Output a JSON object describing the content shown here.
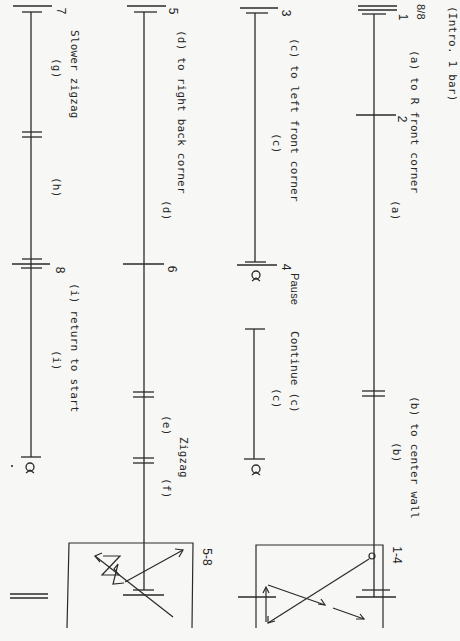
{
  "document": {
    "orientation": "rotated 90 degrees clockwise",
    "intro": "(Intro. 1 bar)",
    "staves": [
      {
        "id": "staff-1",
        "bars": [
          "1",
          "2"
        ],
        "meter": "8/8",
        "annotations": {
          "a_main": "(a) to R front corner",
          "a_label": "(a)",
          "b_main": "(b) to center wall",
          "b_label": "(b)"
        }
      },
      {
        "id": "staff-2",
        "bars": [
          "3",
          "4"
        ],
        "annotations": {
          "c_main": "(c) to left front corner",
          "c_label": "(c)",
          "pause": "Pause",
          "continue": "Continue (c)",
          "c_label2": "(c)"
        }
      },
      {
        "id": "staff-3",
        "bars": [
          "5",
          "6"
        ],
        "annotations": {
          "d_main": "(d) to right back corner",
          "d_label": "(d)",
          "e_label": "(e)",
          "zigzag": "Zigzag",
          "f_label": "(f)"
        }
      },
      {
        "id": "staff-4",
        "bars": [
          "7",
          "8"
        ],
        "annotations": {
          "slower": "Slower zigzag",
          "g_label": "(g)",
          "h_label": "(h)",
          "i_main": "(i) return to start",
          "i_label": "(i)"
        }
      }
    ],
    "diagrams": [
      {
        "id": "floor-pattern-1-4",
        "label": "1-4",
        "paths": [
          "a",
          "b",
          "c",
          "c"
        ]
      },
      {
        "id": "floor-pattern-5-8",
        "label": "5-8",
        "paths": [
          "d",
          "e",
          "f",
          "g",
          "h",
          "i"
        ]
      }
    ]
  }
}
